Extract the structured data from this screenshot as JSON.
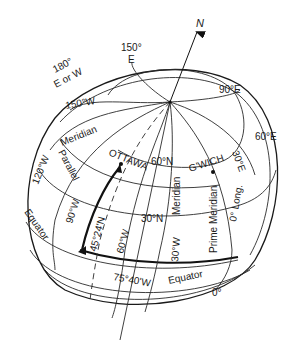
{
  "diagram": {
    "north_label": "N",
    "labels": {
      "lon_180": "180°",
      "lon_180_sub": "E or W",
      "lon_150e": "150°",
      "lon_150e_sub": "E",
      "lon_90e": "90°E",
      "lon_60e": "60°E",
      "lon_150w": "150°W",
      "meridian_upper": "Meridian",
      "lon_120w": "120°W",
      "parallel": "Parallel",
      "ottawa": "OTTAWA",
      "lat_60n": "60°N",
      "gwich": "G'WICH",
      "lon_30e": "30°E",
      "equator_left": "Equator",
      "lon_90w": "90°W",
      "lat_45n": "45°24'N",
      "lat_30n": "30°N",
      "meridian_center": "Meridian",
      "prime_meridian": "Prime Meridian",
      "zero_long": "0° Long.",
      "lon_60w": "60°W",
      "lon_30w": "30°W",
      "lon_ottawa": "75°40'W",
      "equator_bottom": "Equator",
      "zero_deg": "0°"
    },
    "points": {
      "north_pole": {
        "x": 170,
        "y": 102
      },
      "ottawa": {
        "x": 120,
        "y": 165
      },
      "greenwich": {
        "x": 213,
        "y": 172
      }
    },
    "colors": {
      "line": "#2a2a2a",
      "text": "#1a1a1a",
      "background": "#ffffff"
    }
  }
}
